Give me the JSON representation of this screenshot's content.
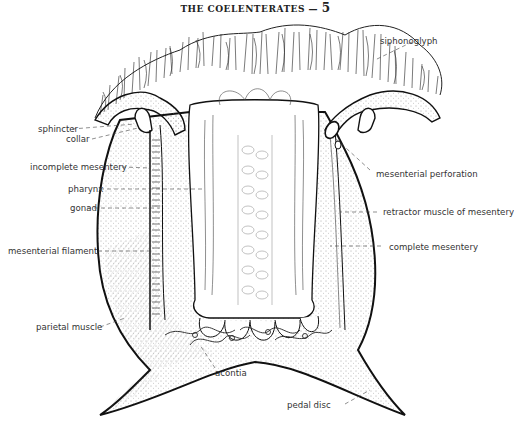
{
  "header": {
    "title": "THE COELENTERATES",
    "dash": "—",
    "page_number": "5"
  },
  "figure": {
    "labels": {
      "siphonoglyph": "siphonoglyph",
      "sphincter": "sphincter",
      "collar": "collar",
      "incomplete_mesentery": "incomplete mesentery",
      "pharynx": "pharynx",
      "gonad": "gonad",
      "mesenterial_filament": "mesenterial filament",
      "parietal_muscle": "parietal muscle",
      "acontia": "acontia",
      "mesenterial_perforation": "mesenterial perforation",
      "retractor_muscle": "retractor muscle of mesentery",
      "complete_mesentery": "complete mesentery",
      "pedal_disc": "pedal disc"
    },
    "caption": "Figure (caption cut off)"
  }
}
